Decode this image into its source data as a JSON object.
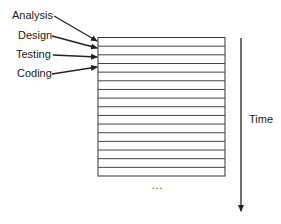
{
  "diagram": {
    "phase_labels": [
      {
        "label": "Analysis"
      },
      {
        "label": "Design"
      },
      {
        "label": "Testing"
      },
      {
        "label": "Coding"
      }
    ],
    "timeline_rows": 16,
    "axis_label": "Time",
    "continuation": "...",
    "colors": {
      "line": "#333333",
      "text": "#1a1a1a",
      "background": "#ffffff"
    }
  }
}
